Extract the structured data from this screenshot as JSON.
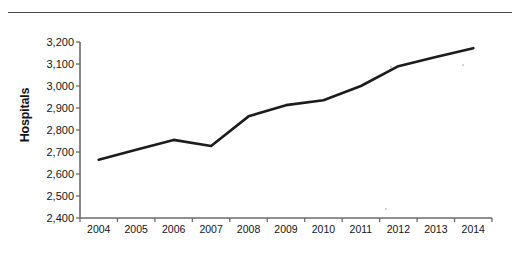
{
  "figure": {
    "rule_color": "#4a4a4a",
    "line_color": "#1c1c1c",
    "axis_color": "#6b6b6b",
    "background": "#ffffff"
  },
  "chart_data": {
    "type": "line",
    "title": "",
    "xlabel": "",
    "ylabel": "Hospitals",
    "categories": [
      "2004",
      "2005",
      "2006",
      "2007",
      "2008",
      "2009",
      "2010",
      "2011",
      "2012",
      "2013",
      "2014"
    ],
    "values": [
      2665,
      2710,
      2755,
      2727,
      2862,
      2913,
      2935,
      3000,
      3090,
      3132,
      3172
    ],
    "series": [
      {
        "name": "Hospitals",
        "values": [
          2665,
          2710,
          2755,
          2727,
          2862,
          2913,
          2935,
          3000,
          3090,
          3132,
          3172
        ]
      }
    ],
    "ylim": [
      2400,
      3200
    ],
    "ytick_values": [
      3200,
      3100,
      3000,
      2900,
      2800,
      2700,
      2600,
      2500,
      2400
    ],
    "ytick_labels": [
      "3,200",
      "3,100",
      "3,000",
      "2,900",
      "2,800",
      "2,700",
      "2,600",
      "2,500",
      "2,400"
    ],
    "grid": false,
    "legend": false,
    "legend_position": "none"
  }
}
